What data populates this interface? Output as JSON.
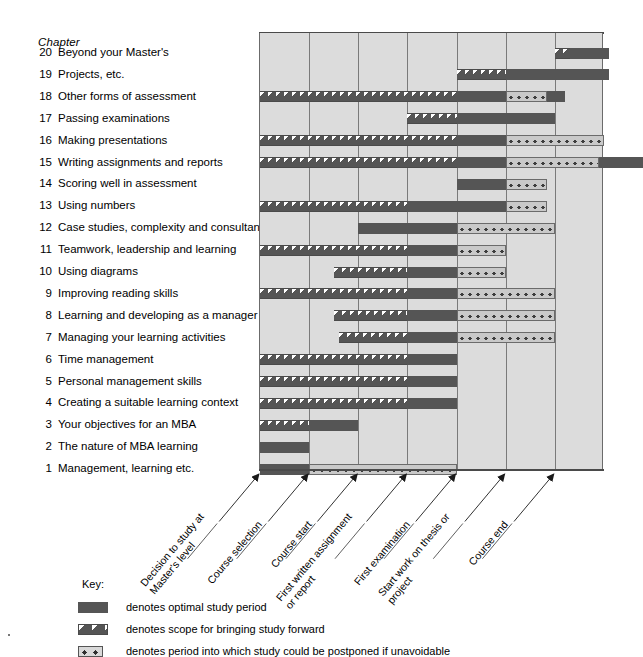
{
  "column_header": "Chapter",
  "chapters": [
    {
      "num": "20",
      "name": "Beyond your Master's"
    },
    {
      "num": "19",
      "name": "Projects, etc."
    },
    {
      "num": "18",
      "name": "Other forms of assessment"
    },
    {
      "num": "17",
      "name": "Passing examinations"
    },
    {
      "num": "16",
      "name": "Making presentations"
    },
    {
      "num": "15",
      "name": "Writing assignments and reports"
    },
    {
      "num": "14",
      "name": "Scoring well in assessment"
    },
    {
      "num": "13",
      "name": "Using numbers"
    },
    {
      "num": "12",
      "name": "Case studies, complexity and consultancy"
    },
    {
      "num": "11",
      "name": "Teamwork, leadership and learning"
    },
    {
      "num": "10",
      "name": "Using diagrams"
    },
    {
      "num": "9",
      "name": "Improving reading skills"
    },
    {
      "num": "8",
      "name": "Learning and developing as a manager"
    },
    {
      "num": "7",
      "name": "Managing your learning activities"
    },
    {
      "num": "6",
      "name": "Time management"
    },
    {
      "num": "5",
      "name": "Personal management skills"
    },
    {
      "num": "4",
      "name": "Creating a suitable learning context"
    },
    {
      "num": "3",
      "name": "Your objectives for an MBA"
    },
    {
      "num": "2",
      "name": "The nature of MBA learning"
    },
    {
      "num": "1",
      "name": "Management, learning etc."
    }
  ],
  "milestones": [
    {
      "label": "Decision to study at\nMaster's level",
      "col": 0
    },
    {
      "label": "Course selection",
      "col": 1
    },
    {
      "label": "Course start",
      "col": 2
    },
    {
      "label": "First written assignment\nor report",
      "col": 3
    },
    {
      "label": "First examination",
      "col": 4
    },
    {
      "label": "Start work on thesis or\nproject",
      "col": 5
    },
    {
      "label": "Course end",
      "col": 6
    }
  ],
  "key": {
    "title": "Key:",
    "entries": [
      {
        "swatch": "solid",
        "text": "denotes optimal study period"
      },
      {
        "swatch": "hatch",
        "text": "denotes scope for bringing study forward"
      },
      {
        "swatch": "dots",
        "text": "denotes period into which study could be postponed if unavoidable"
      }
    ]
  },
  "colors": {
    "panel": "#dcdcdc",
    "bar": "#555555",
    "grid": "#7a7a7a",
    "dots_fill": "#c9c9c9"
  },
  "chart_data": {
    "type": "bar",
    "xlabel": "",
    "ylabel": "Chapter",
    "grid": true,
    "legend": "below",
    "axis_ticks": [
      "Decision to study at Master's level",
      "Course selection",
      "Course start",
      "First written assignment or report",
      "First examination",
      "Start work on thesis or project",
      "Course end"
    ],
    "column_count": 7,
    "categories": [
      "20 Beyond your Master's",
      "19 Projects, etc.",
      "18 Other forms of assessment",
      "17 Passing examinations",
      "16 Making presentations",
      "15 Writing assignments and reports",
      "14 Scoring well in assessment",
      "13 Using numbers",
      "12 Case studies, complexity and consultancy",
      "11 Teamwork, leadership and learning",
      "10 Using diagrams",
      "9 Improving reading skills",
      "8 Learning and developing as a manager",
      "7 Managing your learning activities",
      "6 Time management",
      "5 Personal management skills",
      "4 Creating a suitable learning context",
      "3 Your objectives for an MBA",
      "2 The nature of MBA learning",
      "1 Management, learning etc."
    ],
    "series": [
      {
        "name": "hatch",
        "label": "scope for bringing study forward"
      },
      {
        "name": "solid",
        "label": "optimal study period"
      },
      {
        "name": "dots",
        "label": "period into which study could be postponed"
      }
    ],
    "rows": [
      {
        "chapter": "20",
        "segments": [
          {
            "type": "hatch",
            "start": 6.0,
            "end": 6.3
          },
          {
            "type": "solid",
            "start": 6.3,
            "end": 7.1
          }
        ]
      },
      {
        "chapter": "19",
        "segments": [
          {
            "type": "hatch",
            "start": 4.0,
            "end": 5.0
          },
          {
            "type": "solid",
            "start": 5.0,
            "end": 7.1
          }
        ]
      },
      {
        "chapter": "18",
        "segments": [
          {
            "type": "hatch",
            "start": 0.0,
            "end": 4.0
          },
          {
            "type": "solid",
            "start": 4.0,
            "end": 5.0
          },
          {
            "type": "dots",
            "start": 5.0,
            "end": 5.85
          },
          {
            "type": "solid",
            "start": 5.85,
            "end": 6.2
          }
        ]
      },
      {
        "chapter": "17",
        "segments": [
          {
            "type": "hatch",
            "start": 3.0,
            "end": 4.0
          },
          {
            "type": "solid",
            "start": 4.0,
            "end": 6.0
          }
        ]
      },
      {
        "chapter": "16",
        "segments": [
          {
            "type": "hatch",
            "start": 0.0,
            "end": 4.0
          },
          {
            "type": "solid",
            "start": 4.0,
            "end": 5.0
          },
          {
            "type": "dots",
            "start": 5.0,
            "end": 7.0
          }
        ]
      },
      {
        "chapter": "15",
        "segments": [
          {
            "type": "hatch",
            "start": 0.0,
            "end": 4.0
          },
          {
            "type": "solid",
            "start": 4.0,
            "end": 5.0
          },
          {
            "type": "dots",
            "start": 5.0,
            "end": 6.9
          },
          {
            "type": "solid",
            "start": 6.9,
            "end": 7.8
          }
        ]
      },
      {
        "chapter": "14",
        "segments": [
          {
            "type": "solid",
            "start": 4.0,
            "end": 5.0
          },
          {
            "type": "dots",
            "start": 5.0,
            "end": 5.85
          }
        ]
      },
      {
        "chapter": "13",
        "segments": [
          {
            "type": "hatch",
            "start": 0.0,
            "end": 3.0
          },
          {
            "type": "solid",
            "start": 3.0,
            "end": 5.0
          },
          {
            "type": "dots",
            "start": 5.0,
            "end": 5.85
          }
        ]
      },
      {
        "chapter": "12",
        "segments": [
          {
            "type": "solid",
            "start": 2.0,
            "end": 4.0
          },
          {
            "type": "dots",
            "start": 4.0,
            "end": 6.0
          }
        ]
      },
      {
        "chapter": "11",
        "segments": [
          {
            "type": "hatch",
            "start": 0.0,
            "end": 3.0
          },
          {
            "type": "solid",
            "start": 3.0,
            "end": 4.0
          },
          {
            "type": "dots",
            "start": 4.0,
            "end": 5.0
          }
        ]
      },
      {
        "chapter": "10",
        "segments": [
          {
            "type": "hatch",
            "start": 1.5,
            "end": 3.0
          },
          {
            "type": "solid",
            "start": 3.0,
            "end": 4.0
          },
          {
            "type": "dots",
            "start": 4.0,
            "end": 5.0
          }
        ]
      },
      {
        "chapter": "9",
        "segments": [
          {
            "type": "hatch",
            "start": 0.0,
            "end": 3.0
          },
          {
            "type": "solid",
            "start": 3.0,
            "end": 4.0
          },
          {
            "type": "dots",
            "start": 4.0,
            "end": 6.0
          }
        ]
      },
      {
        "chapter": "8",
        "segments": [
          {
            "type": "hatch",
            "start": 1.5,
            "end": 3.0
          },
          {
            "type": "solid",
            "start": 3.0,
            "end": 4.0
          },
          {
            "type": "dots",
            "start": 4.0,
            "end": 6.0
          }
        ]
      },
      {
        "chapter": "7",
        "segments": [
          {
            "type": "hatch",
            "start": 1.6,
            "end": 3.0
          },
          {
            "type": "solid",
            "start": 3.0,
            "end": 4.0
          },
          {
            "type": "dots",
            "start": 4.0,
            "end": 6.0
          }
        ]
      },
      {
        "chapter": "6",
        "segments": [
          {
            "type": "hatch",
            "start": 0.0,
            "end": 3.0
          },
          {
            "type": "solid",
            "start": 3.0,
            "end": 4.0
          }
        ]
      },
      {
        "chapter": "5",
        "segments": [
          {
            "type": "hatch",
            "start": 0.0,
            "end": 3.0
          },
          {
            "type": "solid",
            "start": 3.0,
            "end": 4.0
          }
        ]
      },
      {
        "chapter": "4",
        "segments": [
          {
            "type": "hatch",
            "start": 0.0,
            "end": 3.0
          },
          {
            "type": "solid",
            "start": 3.0,
            "end": 4.0
          }
        ]
      },
      {
        "chapter": "3",
        "segments": [
          {
            "type": "hatch",
            "start": 0.0,
            "end": 1.0
          },
          {
            "type": "solid",
            "start": 1.0,
            "end": 2.0
          }
        ]
      },
      {
        "chapter": "2",
        "segments": [
          {
            "type": "solid",
            "start": 0.0,
            "end": 1.0
          }
        ]
      },
      {
        "chapter": "1",
        "segments": [
          {
            "type": "solid",
            "start": 0.0,
            "end": 1.0
          },
          {
            "type": "dots",
            "start": 1.0,
            "end": 4.0
          }
        ]
      }
    ]
  }
}
